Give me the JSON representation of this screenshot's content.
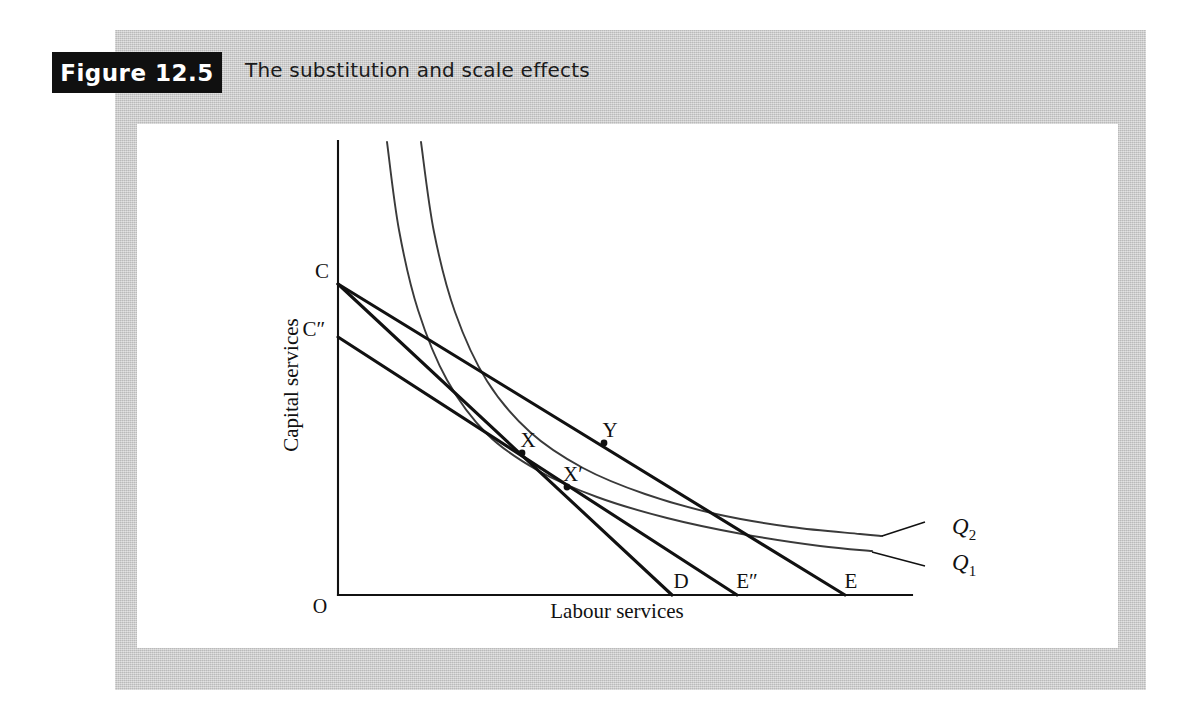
{
  "figure": {
    "badge_label": "Figure 12.5",
    "caption": "The substitution and scale effects"
  },
  "chart_data": {
    "type": "line",
    "title": "The substitution and scale effects",
    "xlabel": "Labour services",
    "ylabel": "Capital services",
    "origin_label": "O",
    "grid": false,
    "legend": "inline-right",
    "axes": {
      "x_axis_from": [
        338,
        595
      ],
      "x_axis_to": [
        912,
        595
      ],
      "y_axis_from": [
        338,
        141
      ],
      "y_axis_to": [
        338,
        595
      ]
    },
    "series": [
      {
        "name": "Q1",
        "kind": "isoquant",
        "label": "Q",
        "label_sub": "1",
        "points": [
          [
            387,
            142
          ],
          [
            399,
            230
          ],
          [
            418,
            310
          ],
          [
            447,
            380
          ],
          [
            487,
            434
          ],
          [
            537,
            470
          ],
          [
            597,
            497
          ],
          [
            667,
            518
          ],
          [
            742,
            534
          ],
          [
            820,
            546
          ],
          [
            872,
            551
          ]
        ],
        "label_anchor": [
          952,
          570
        ],
        "leader_from": [
          872,
          552
        ],
        "leader_to": [
          925,
          566
        ]
      },
      {
        "name": "Q2",
        "kind": "isoquant",
        "label": "Q",
        "label_sub": "2",
        "points": [
          [
            421,
            142
          ],
          [
            434,
            232
          ],
          [
            455,
            312
          ],
          [
            487,
            381
          ],
          [
            530,
            432
          ],
          [
            583,
            468
          ],
          [
            645,
            494
          ],
          [
            716,
            514
          ],
          [
            791,
            527
          ],
          [
            860,
            534
          ],
          [
            882,
            536
          ]
        ],
        "label_anchor": [
          952,
          534
        ],
        "leader_from": [
          882,
          536
        ],
        "leader_to": [
          925,
          522
        ]
      },
      {
        "name": "budget-line-CD",
        "kind": "isocost",
        "from_label": "C",
        "to_label": "D",
        "from": [
          338,
          284
        ],
        "to": [
          672,
          595
        ]
      },
      {
        "name": "budget-line-CE",
        "kind": "isocost",
        "from_label": "C",
        "to_label": "E",
        "from": [
          338,
          284
        ],
        "to": [
          845,
          595
        ]
      },
      {
        "name": "budget-line-C2E2",
        "kind": "isocost",
        "from_label": "C″",
        "to_label": "E″",
        "from": [
          338,
          337
        ],
        "to": [
          737,
          595
        ]
      }
    ],
    "annotations": [
      {
        "name": "point-C",
        "label": "C",
        "point": [
          338,
          284
        ],
        "label_pos": [
          322,
          278
        ],
        "marker": false
      },
      {
        "name": "point-C2",
        "label": "C″",
        "point": [
          338,
          337
        ],
        "label_pos": [
          314,
          336
        ],
        "marker": false
      },
      {
        "name": "point-X",
        "label": "X",
        "point": [
          522,
          453
        ],
        "label_pos": [
          528,
          447
        ],
        "marker": true
      },
      {
        "name": "point-Y",
        "label": "Y",
        "point": [
          604,
          443
        ],
        "label_pos": [
          610,
          437
        ],
        "marker": true
      },
      {
        "name": "point-Xp",
        "label": "X′",
        "point": [
          567,
          487
        ],
        "label_pos": [
          573,
          481
        ],
        "marker": true
      },
      {
        "name": "point-D",
        "label": "D",
        "point": [
          672,
          595
        ],
        "label_pos": [
          681,
          588
        ],
        "marker": false
      },
      {
        "name": "point-E2",
        "label": "E″",
        "point": [
          737,
          595
        ],
        "label_pos": [
          747,
          588
        ],
        "marker": false
      },
      {
        "name": "point-E",
        "label": "E",
        "point": [
          845,
          595
        ],
        "label_pos": [
          851,
          588
        ],
        "marker": false
      }
    ],
    "axis_label_positions": {
      "ylabel_pos": [
        298,
        385
      ],
      "xlabel_pos": [
        617,
        618
      ],
      "origin_pos": [
        320,
        613
      ]
    }
  },
  "colors": {
    "mat": "#c9c9c9",
    "panel": "#ffffff",
    "badge_bg": "#101010",
    "badge_fg": "#ffffff",
    "ink": "#111111",
    "isoquant": "#3a3a3a"
  }
}
